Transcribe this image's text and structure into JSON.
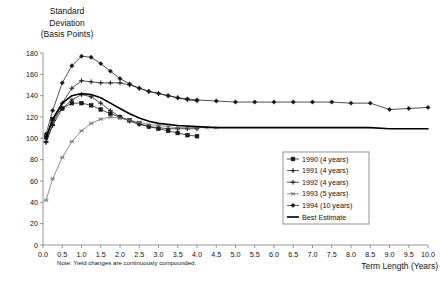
{
  "chart_data": {
    "type": "line",
    "title": "Standard Deviation (Basis Points)",
    "ylabel_lines": [
      "Standard",
      "Deviation",
      "(Basis Points)"
    ],
    "xlabel": "Term Length (Years)",
    "note": "Note: Yield changes are continuously compounded.",
    "xlim": [
      0,
      10
    ],
    "ylim": [
      0,
      180
    ],
    "ygrid": false,
    "xgrid": false,
    "yticks": [
      0,
      20,
      40,
      60,
      80,
      100,
      120,
      140,
      160,
      180
    ],
    "xticks": [
      "0.0",
      "0.5",
      "1.0",
      "1.5",
      "2.0",
      "2.5",
      "3.0",
      "3.5",
      "4.0",
      "4.5",
      "5.0",
      "5.5",
      "6.0",
      "6.5",
      "7.0",
      "7.5",
      "8.0",
      "8.5",
      "9.0",
      "9.5",
      "10.0"
    ],
    "xtick_values": [
      0,
      0.5,
      1,
      1.5,
      2,
      2.5,
      3,
      3.5,
      4,
      4.5,
      5,
      5.5,
      6,
      6.5,
      7,
      7.5,
      8,
      8.5,
      9,
      9.5,
      10
    ],
    "legend_position": "lower-right",
    "series": [
      {
        "name": "1990 (4 years)",
        "marker": "square",
        "color": "#1a1a1a",
        "x": [
          0.08,
          0.25,
          0.5,
          0.75,
          1.0,
          1.25,
          1.5,
          1.75,
          2.0,
          2.25,
          2.5,
          2.75,
          3.0,
          3.25,
          3.5,
          3.75,
          4.0
        ],
        "y": [
          101,
          118,
          128,
          133,
          133,
          131,
          127,
          123,
          120,
          117,
          114,
          111,
          109,
          107,
          105,
          103,
          102
        ]
      },
      {
        "name": "1991 (4 years)",
        "marker": "cross",
        "color": "#1a1a1a",
        "x": [
          0.08,
          0.25,
          0.5,
          0.75,
          1.0,
          1.25,
          1.5,
          1.75,
          2.0,
          2.25,
          2.5,
          2.75,
          3.0,
          3.25,
          3.5,
          3.75,
          4.0
        ],
        "y": [
          97,
          112,
          128,
          136,
          141,
          139,
          133,
          126,
          120,
          116,
          113,
          111,
          110,
          109,
          109,
          109,
          109
        ]
      },
      {
        "name": "1992 (4 years)",
        "marker": "plus",
        "color": "#1a1a1a",
        "x": [
          0.08,
          0.25,
          0.5,
          0.75,
          1.0,
          1.25,
          1.5,
          1.75,
          2.0,
          2.25,
          2.5,
          2.75,
          3.0,
          3.25,
          3.5,
          3.75,
          4.0
        ],
        "y": [
          96,
          113,
          133,
          147,
          154,
          153,
          152,
          152,
          152,
          150,
          147,
          144,
          142,
          140,
          138,
          136,
          135
        ]
      },
      {
        "name": "1993 (5 years)",
        "marker": "star",
        "color": "#6b6b6b",
        "x": [
          0.08,
          0.25,
          0.5,
          0.75,
          1.0,
          1.25,
          1.5,
          1.75,
          2.0,
          2.25,
          2.5,
          2.75,
          3.0,
          3.25,
          3.5,
          3.75,
          4.0,
          4.25,
          4.5
        ],
        "y": [
          42,
          62,
          82,
          97,
          107,
          114,
          118,
          120,
          119,
          117,
          115,
          113,
          112,
          111,
          110,
          110,
          110,
          110,
          110
        ]
      },
      {
        "name": "1994 (10 years)",
        "marker": "diamond",
        "color": "#1a1a1a",
        "x": [
          0.08,
          0.25,
          0.5,
          0.75,
          1.0,
          1.25,
          1.5,
          1.75,
          2.0,
          2.25,
          2.5,
          2.75,
          3.0,
          3.25,
          3.5,
          3.75,
          4.0,
          4.5,
          5.0,
          5.5,
          6.0,
          6.5,
          7.0,
          7.5,
          8.0,
          8.5,
          9.0,
          9.5,
          10.0
        ],
        "y": [
          104,
          126,
          152,
          168,
          177,
          176,
          170,
          163,
          156,
          151,
          147,
          144,
          142,
          140,
          138,
          137,
          136,
          135,
          134,
          134,
          134,
          134,
          134,
          134,
          133,
          133,
          127,
          128,
          129
        ]
      },
      {
        "name": "Best Estimate",
        "marker": "none",
        "color": "#000000",
        "line_width": 1.6,
        "x": [
          0.08,
          0.25,
          0.5,
          0.75,
          1.0,
          1.25,
          1.5,
          1.75,
          2.0,
          2.25,
          2.5,
          2.75,
          3.0,
          3.5,
          4.0,
          4.5,
          5.0,
          5.5,
          6.0,
          6.5,
          7.0,
          7.5,
          8.0,
          8.5,
          9.0,
          9.5,
          10.0
        ],
        "y": [
          100,
          118,
          133,
          140,
          142,
          141,
          138,
          133,
          128,
          123,
          119,
          116,
          114,
          112,
          111,
          110,
          110,
          110,
          110,
          110,
          110,
          110,
          110,
          110,
          109,
          109,
          109
        ]
      }
    ]
  }
}
